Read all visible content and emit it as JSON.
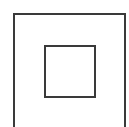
{
  "diagram": {
    "type": "nested-squares",
    "stroke_color": "#3a3a3a",
    "background": "#ffffff",
    "shapes": [
      {
        "name": "outer-square",
        "kind": "square",
        "note": "bottom edge cropped out of frame"
      },
      {
        "name": "inner-square",
        "kind": "square"
      }
    ]
  }
}
